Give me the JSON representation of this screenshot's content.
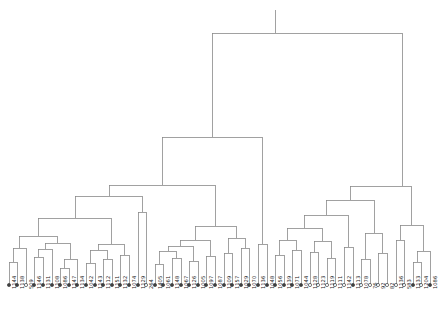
{
  "figure": {
    "kind": "dendrogram",
    "title": "",
    "background_color": "#ffffff",
    "line_color": "#8a8a8a",
    "line_width": 0.8,
    "label_color": "#1a1a1a",
    "marker_filled_color": "#404040",
    "marker_open_color": "#ffffff",
    "marker_edge_color": "#404040",
    "marker_radius": 1.6,
    "axis_visible": false,
    "baseline_y": 285,
    "top_y": 10
  },
  "chart_data": {
    "type": "dendrogram",
    "title": "",
    "xlabel": "",
    "ylabel": "",
    "orientation": "top-down",
    "leaf_count": 50,
    "leaf_spacing_px": 8.6,
    "leaf_origin_px": 9,
    "leaves": [
      {
        "index": 0,
        "label": "1144",
        "x": 9,
        "marker": "filled"
      },
      {
        "index": 1,
        "label": "1138",
        "x": 17,
        "marker": "filled"
      },
      {
        "index": 2,
        "label": "509",
        "x": 26,
        "marker": "open"
      },
      {
        "index": 3,
        "label": "1146",
        "x": 34,
        "marker": "filled"
      },
      {
        "index": 4,
        "label": "1131",
        "x": 43,
        "marker": "filled"
      },
      {
        "index": 5,
        "label": "1108",
        "x": 52,
        "marker": "filled"
      },
      {
        "index": 6,
        "label": "1086",
        "x": 60,
        "marker": "filled"
      },
      {
        "index": 7,
        "label": "1147",
        "x": 69,
        "marker": "filled"
      },
      {
        "index": 8,
        "label": "1134",
        "x": 77,
        "marker": "filled"
      },
      {
        "index": 9,
        "label": "1042",
        "x": 86,
        "marker": "filled"
      },
      {
        "index": 10,
        "label": "1143",
        "x": 95,
        "marker": "filled"
      },
      {
        "index": 11,
        "label": "1112",
        "x": 103,
        "marker": "filled"
      },
      {
        "index": 12,
        "label": "1151",
        "x": 112,
        "marker": "filled"
      },
      {
        "index": 13,
        "label": "1132",
        "x": 120,
        "marker": "filled"
      },
      {
        "index": 14,
        "label": "1074",
        "x": 129,
        "marker": "filled"
      },
      {
        "index": 15,
        "label": "1129",
        "x": 138,
        "marker": "filled"
      },
      {
        "index": 16,
        "label": "264",
        "x": 146,
        "marker": "open"
      },
      {
        "index": 17,
        "label": "1405",
        "x": 155,
        "marker": "filled"
      },
      {
        "index": 18,
        "label": "1061",
        "x": 163,
        "marker": "filled"
      },
      {
        "index": 19,
        "label": "1148",
        "x": 172,
        "marker": "filled"
      },
      {
        "index": 20,
        "label": "1067",
        "x": 181,
        "marker": "filled"
      },
      {
        "index": 21,
        "label": "1126",
        "x": 189,
        "marker": "filled"
      },
      {
        "index": 22,
        "label": "1005",
        "x": 198,
        "marker": "filled"
      },
      {
        "index": 23,
        "label": "1097",
        "x": 206,
        "marker": "filled"
      },
      {
        "index": 24,
        "label": "1087",
        "x": 215,
        "marker": "filled"
      },
      {
        "index": 25,
        "label": "1109",
        "x": 224,
        "marker": "filled"
      },
      {
        "index": 26,
        "label": "1157",
        "x": 232,
        "marker": "filled"
      },
      {
        "index": 27,
        "label": "1029",
        "x": 241,
        "marker": "filled"
      },
      {
        "index": 28,
        "label": "1070",
        "x": 249,
        "marker": "filled"
      },
      {
        "index": 29,
        "label": "1136",
        "x": 258,
        "marker": "filled"
      },
      {
        "index": 30,
        "label": "1048",
        "x": 267,
        "marker": "filled"
      },
      {
        "index": 31,
        "label": "1056",
        "x": 275,
        "marker": "filled"
      },
      {
        "index": 32,
        "label": "1139",
        "x": 284,
        "marker": "filled"
      },
      {
        "index": 33,
        "label": "1071",
        "x": 292,
        "marker": "filled"
      },
      {
        "index": 34,
        "label": "1044",
        "x": 301,
        "marker": "filled"
      },
      {
        "index": 35,
        "label": "1128",
        "x": 310,
        "marker": "open"
      },
      {
        "index": 36,
        "label": "1123",
        "x": 318,
        "marker": "open"
      },
      {
        "index": 37,
        "label": "1119",
        "x": 327,
        "marker": "open"
      },
      {
        "index": 38,
        "label": "1111",
        "x": 335,
        "marker": "open"
      },
      {
        "index": 39,
        "label": "1142",
        "x": 344,
        "marker": "open"
      },
      {
        "index": 40,
        "label": "1113",
        "x": 353,
        "marker": "filled"
      },
      {
        "index": 41,
        "label": "1078",
        "x": 361,
        "marker": "open"
      },
      {
        "index": 42,
        "label": "76",
        "x": 370,
        "marker": "open"
      },
      {
        "index": 43,
        "label": "92",
        "x": 378,
        "marker": "open"
      },
      {
        "index": 44,
        "label": "82",
        "x": 387,
        "marker": "open"
      },
      {
        "index": 45,
        "label": "1136",
        "x": 396,
        "marker": "open"
      },
      {
        "index": 46,
        "label": "583",
        "x": 404,
        "marker": "open"
      },
      {
        "index": 47,
        "label": "1133",
        "x": 413,
        "marker": "filled"
      },
      {
        "index": 48,
        "label": "1204",
        "x": 421,
        "marker": "open"
      },
      {
        "index": 49,
        "label": "1086",
        "x": 430,
        "marker": "filled"
      }
    ],
    "merges": [
      {
        "id": "m0",
        "left_x": 9,
        "right_x": 17,
        "left_y": 285,
        "right_y": 285,
        "height_y": 262
      },
      {
        "id": "m1",
        "left_x": 13,
        "right_x": 26,
        "left_y": 262,
        "right_y": 285,
        "height_y": 248
      },
      {
        "id": "m2",
        "left_x": 34,
        "right_x": 43,
        "left_y": 285,
        "right_y": 285,
        "height_y": 257
      },
      {
        "id": "m3",
        "left_x": 38,
        "right_x": 52,
        "left_y": 257,
        "right_y": 285,
        "height_y": 249
      },
      {
        "id": "m4",
        "left_x": 60,
        "right_x": 69,
        "left_y": 285,
        "right_y": 285,
        "height_y": 268
      },
      {
        "id": "m5",
        "left_x": 64,
        "right_x": 77,
        "left_y": 268,
        "right_y": 285,
        "height_y": 259
      },
      {
        "id": "m6",
        "left_x": 45,
        "right_x": 70,
        "left_y": 249,
        "right_y": 259,
        "height_y": 243
      },
      {
        "id": "m7",
        "left_x": 19,
        "right_x": 57,
        "left_y": 248,
        "right_y": 243,
        "height_y": 236
      },
      {
        "id": "m8",
        "left_x": 86,
        "right_x": 95,
        "left_y": 285,
        "right_y": 285,
        "height_y": 263
      },
      {
        "id": "m9",
        "left_x": 103,
        "right_x": 112,
        "left_y": 285,
        "right_y": 285,
        "height_y": 259
      },
      {
        "id": "m10",
        "left_x": 90,
        "right_x": 107,
        "left_y": 263,
        "right_y": 259,
        "height_y": 250
      },
      {
        "id": "m11",
        "left_x": 120,
        "right_x": 129,
        "left_y": 285,
        "right_y": 285,
        "height_y": 255
      },
      {
        "id": "m12",
        "left_x": 98,
        "right_x": 124,
        "left_y": 250,
        "right_y": 255,
        "height_y": 244
      },
      {
        "id": "m13",
        "left_x": 38,
        "right_x": 111,
        "left_y": 236,
        "right_y": 244,
        "height_y": 218
      },
      {
        "id": "m14",
        "left_x": 138,
        "right_x": 146,
        "left_y": 285,
        "right_y": 285,
        "height_y": 212
      },
      {
        "id": "m15",
        "left_x": 75,
        "right_x": 142,
        "left_y": 218,
        "right_y": 212,
        "height_y": 196
      },
      {
        "id": "m16",
        "left_x": 155,
        "right_x": 163,
        "left_y": 285,
        "right_y": 285,
        "height_y": 264
      },
      {
        "id": "m17",
        "left_x": 172,
        "right_x": 181,
        "left_y": 285,
        "right_y": 285,
        "height_y": 258
      },
      {
        "id": "m18",
        "left_x": 159,
        "right_x": 176,
        "left_y": 264,
        "right_y": 258,
        "height_y": 251
      },
      {
        "id": "m19",
        "left_x": 189,
        "right_x": 198,
        "left_y": 285,
        "right_y": 285,
        "height_y": 261
      },
      {
        "id": "m20",
        "left_x": 168,
        "right_x": 193,
        "left_y": 251,
        "right_y": 261,
        "height_y": 246
      },
      {
        "id": "m21",
        "left_x": 206,
        "right_x": 215,
        "left_y": 285,
        "right_y": 285,
        "height_y": 256
      },
      {
        "id": "m22",
        "left_x": 180,
        "right_x": 210,
        "left_y": 246,
        "right_y": 256,
        "height_y": 240
      },
      {
        "id": "m23",
        "left_x": 224,
        "right_x": 232,
        "left_y": 285,
        "right_y": 285,
        "height_y": 253
      },
      {
        "id": "m24",
        "left_x": 241,
        "right_x": 249,
        "left_y": 285,
        "right_y": 285,
        "height_y": 248
      },
      {
        "id": "m25",
        "left_x": 228,
        "right_x": 245,
        "left_y": 253,
        "right_y": 248,
        "height_y": 238
      },
      {
        "id": "m26",
        "left_x": 195,
        "right_x": 236,
        "left_y": 240,
        "right_y": 238,
        "height_y": 226
      },
      {
        "id": "m27",
        "left_x": 109,
        "right_x": 215,
        "left_y": 196,
        "right_y": 226,
        "height_y": 185
      },
      {
        "id": "m28",
        "left_x": 258,
        "right_x": 267,
        "left_y": 285,
        "right_y": 285,
        "height_y": 244
      },
      {
        "id": "m29",
        "left_x": 162,
        "right_x": 262,
        "left_y": 185,
        "right_y": 244,
        "height_y": 137
      },
      {
        "id": "m30",
        "left_x": 275,
        "right_x": 284,
        "left_y": 285,
        "right_y": 285,
        "height_y": 255
      },
      {
        "id": "m31",
        "left_x": 292,
        "right_x": 301,
        "left_y": 285,
        "right_y": 285,
        "height_y": 250
      },
      {
        "id": "m32",
        "left_x": 279,
        "right_x": 296,
        "left_y": 255,
        "right_y": 250,
        "height_y": 240
      },
      {
        "id": "m33",
        "left_x": 310,
        "right_x": 318,
        "left_y": 285,
        "right_y": 285,
        "height_y": 252
      },
      {
        "id": "m34",
        "left_x": 327,
        "right_x": 335,
        "left_y": 285,
        "right_y": 285,
        "height_y": 258
      },
      {
        "id": "m35",
        "left_x": 314,
        "right_x": 331,
        "left_y": 252,
        "right_y": 258,
        "height_y": 241
      },
      {
        "id": "m36",
        "left_x": 287,
        "right_x": 322,
        "left_y": 240,
        "right_y": 241,
        "height_y": 228
      },
      {
        "id": "m37",
        "left_x": 344,
        "right_x": 353,
        "left_y": 285,
        "right_y": 285,
        "height_y": 247
      },
      {
        "id": "m38",
        "left_x": 304,
        "right_x": 348,
        "left_y": 228,
        "right_y": 247,
        "height_y": 215
      },
      {
        "id": "m39",
        "left_x": 361,
        "right_x": 370,
        "left_y": 285,
        "right_y": 285,
        "height_y": 259
      },
      {
        "id": "m40",
        "left_x": 378,
        "right_x": 387,
        "left_y": 285,
        "right_y": 285,
        "height_y": 253
      },
      {
        "id": "m41",
        "left_x": 365,
        "right_x": 382,
        "left_y": 259,
        "right_y": 253,
        "height_y": 233
      },
      {
        "id": "m42",
        "left_x": 326,
        "right_x": 374,
        "left_y": 215,
        "right_y": 233,
        "height_y": 200
      },
      {
        "id": "m43",
        "left_x": 396,
        "right_x": 404,
        "left_y": 285,
        "right_y": 285,
        "height_y": 240
      },
      {
        "id": "m44",
        "left_x": 413,
        "right_x": 421,
        "left_y": 285,
        "right_y": 285,
        "height_y": 262
      },
      {
        "id": "m45",
        "left_x": 417,
        "right_x": 430,
        "left_y": 262,
        "right_y": 285,
        "height_y": 251
      },
      {
        "id": "m46",
        "left_x": 400,
        "right_x": 423,
        "left_y": 240,
        "right_y": 251,
        "height_y": 225
      },
      {
        "id": "m47",
        "left_x": 350,
        "right_x": 411,
        "left_y": 200,
        "right_y": 225,
        "height_y": 186
      },
      {
        "id": "m48",
        "left_x": 212,
        "right_x": 402,
        "left_y": 137,
        "right_y": 186,
        "height_y": 33
      }
    ],
    "root": {
      "x": 275,
      "y": 33,
      "stem_top_y": 10
    }
  }
}
